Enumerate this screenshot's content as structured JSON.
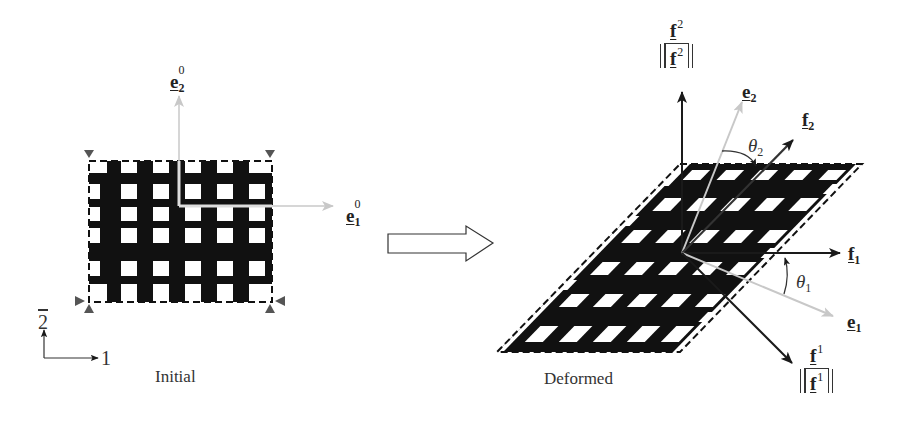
{
  "figure": {
    "panels": [
      {
        "id": "initial",
        "caption": "Initial",
        "basis": {
          "e1_0": {
            "symbol": "e",
            "subscript": "1",
            "superscript": "0",
            "color": "#c8c8c8"
          },
          "e2_0": {
            "symbol": "e",
            "subscript": "2",
            "superscript": "0",
            "color": "#c8c8c8"
          }
        },
        "grid": {
          "hole_rows": 6,
          "hole_cols": 6,
          "fill": "#111111",
          "border": "dashed"
        },
        "supports": 4
      },
      {
        "id": "deformed",
        "caption": "Deformed",
        "basis": {
          "e1": {
            "symbol": "e",
            "subscript": "1",
            "color": "#c8c8c8"
          },
          "e2": {
            "symbol": "e",
            "subscript": "2",
            "color": "#c8c8c8"
          },
          "f1": {
            "symbol": "f",
            "subscript": "1",
            "color": "#222222"
          },
          "f2": {
            "symbol": "f",
            "subscript": "2",
            "color": "#222222"
          }
        },
        "normalized_duals": {
          "f_sup1": {
            "numerator": "f",
            "superscript": "1",
            "denominator": "f"
          },
          "f_sup2": {
            "numerator": "f",
            "superscript": "2",
            "denominator": "f"
          }
        },
        "angles": {
          "theta1": {
            "symbol": "θ",
            "subscript": "1"
          },
          "theta2": {
            "symbol": "θ",
            "subscript": "2"
          }
        },
        "grid": {
          "hole_rows": 6,
          "hole_cols": 6,
          "fill": "#111111",
          "border": "dashed"
        }
      }
    ],
    "global_axes": {
      "x_label": "1",
      "y_label": "2"
    },
    "transition_arrow": "hollow-right-arrow",
    "colors": {
      "ink": "#111111",
      "light_vector": "#c8c8c8",
      "support": "#555555"
    }
  }
}
